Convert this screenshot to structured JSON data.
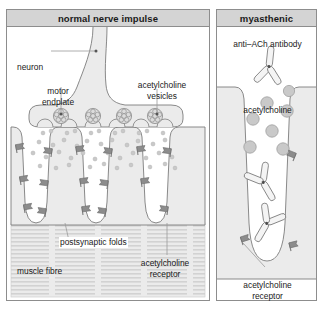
{
  "figure": {
    "type": "diagram",
    "colors": {
      "header_band": "#d4d4d4",
      "panel_border": "#8d8d8d",
      "cell_fill": "#e6e6e6",
      "outline": "#6e6e6e",
      "receptor": "#8c8c8c",
      "vesicle": "#d8d8d8",
      "acetylcholine_dot": "#c6c6c6",
      "antibody_fill": "#f2f2f2",
      "text": "#1a1a1a"
    }
  },
  "panels": [
    {
      "id": "normal",
      "title": "normal nerve impulse",
      "labels": [
        {
          "name": "neuron",
          "text": "neuron"
        },
        {
          "name": "motor-endplate",
          "line1": "motor",
          "line2": "endplate"
        },
        {
          "name": "acetylcholine-vesicles",
          "line1": "acetylcholine",
          "line2": "vesicles"
        },
        {
          "name": "postsynaptic-folds",
          "text": "postsynaptic folds"
        },
        {
          "name": "muscle-fibre",
          "text": "muscle fibre"
        },
        {
          "name": "acetylcholine-receptor",
          "line1": "acetylcholine",
          "line2": "receptor"
        }
      ],
      "counts": {
        "vesicles": 4,
        "acetylcholine_dots": 44,
        "receptors": 16,
        "postsynaptic_folds": 3
      }
    },
    {
      "id": "myasthenic",
      "title": "myasthenic",
      "labels": [
        {
          "name": "anti-ach-antibody",
          "text": "anti–ACh antibody"
        },
        {
          "name": "acetylcholine",
          "text": "acetylcholine"
        },
        {
          "name": "acetylcholine-receptor",
          "line1": "acetylcholine",
          "line2": "receptor"
        }
      ],
      "counts": {
        "antibodies": 3,
        "acetylcholine_molecules": 7,
        "receptors": 3
      }
    }
  ]
}
